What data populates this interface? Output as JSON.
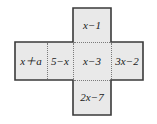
{
  "figure": {
    "kind": "cube-net-cross",
    "colors": {
      "cell_fill": "#e9e9e9",
      "outline": "#3a3a3a",
      "divider": "#7a7a7a",
      "text": "#1a1a1a",
      "background": "#ffffff"
    },
    "cells": {
      "top": {
        "label": "x−1"
      },
      "left_outer": {
        "label": "x＋a"
      },
      "left_inner": {
        "label": "5−x"
      },
      "center": {
        "label": "x−3"
      },
      "right_outer": {
        "label": "3x−2"
      },
      "bottom": {
        "label": "2x−7"
      }
    }
  }
}
